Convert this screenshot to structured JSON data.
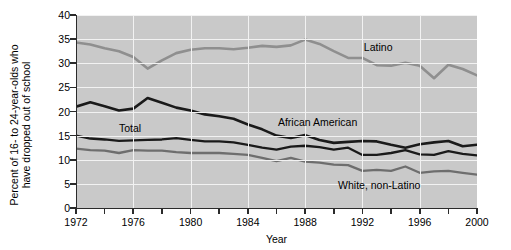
{
  "chart_data": {
    "type": "line",
    "title": "",
    "xlabel": "Year",
    "ylabel": "Percent of 16- to 24-year-olds who have dropped out of school",
    "ylabel_line1": "Percent of 16- to 24-year-olds who",
    "ylabel_line2": "have dropped out of school",
    "xlim": [
      1972,
      2000
    ],
    "ylim": [
      0,
      40
    ],
    "grid": true,
    "legend_position": "inline-annotations",
    "x": [
      1972,
      1973,
      1974,
      1975,
      1976,
      1977,
      1978,
      1979,
      1980,
      1981,
      1982,
      1983,
      1984,
      1985,
      1986,
      1987,
      1988,
      1989,
      1990,
      1991,
      1992,
      1993,
      1994,
      1995,
      1996,
      1997,
      1998,
      1999,
      2000
    ],
    "xticks": [
      1972,
      1974,
      1976,
      1978,
      1980,
      1982,
      1984,
      1986,
      1988,
      1990,
      1992,
      1994,
      1996,
      1998,
      2000
    ],
    "xticklabels": [
      "1972",
      "",
      "1976",
      "",
      "1980",
      "",
      "1984",
      "",
      "1988",
      "",
      "1992",
      "",
      "1996",
      "",
      "2000"
    ],
    "yticks": [
      0,
      5,
      10,
      15,
      20,
      25,
      30,
      35,
      40
    ],
    "yticklabels": [
      "0",
      "5",
      "10",
      "15",
      "20",
      "25",
      "30",
      "35",
      "40"
    ],
    "series": [
      {
        "name": "Latino",
        "color": "#8f8f8f",
        "width": 2.6,
        "label_x": 1992.1,
        "label_y": 33.2,
        "values": [
          34.3,
          33.9,
          33.1,
          32.5,
          31.3,
          28.9,
          30.6,
          32.1,
          32.8,
          33.1,
          33.1,
          32.9,
          33.2,
          33.6,
          33.4,
          33.7,
          34.9,
          34.0,
          32.5,
          31.1,
          31.1,
          29.6,
          29.5,
          30.1,
          29.5,
          26.9,
          29.7,
          28.8,
          27.5
        ]
      },
      {
        "name": "African American",
        "color": "#1a1a1a",
        "width": 2.6,
        "label_x": 1986.1,
        "label_y": 17.6,
        "values": [
          21.0,
          21.9,
          21.1,
          20.2,
          20.6,
          22.8,
          21.8,
          20.8,
          20.2,
          19.4,
          19.0,
          18.5,
          17.3,
          16.3,
          15.0,
          14.5,
          15.1,
          14.1,
          13.5,
          13.7,
          13.9,
          13.8,
          13.1,
          12.5,
          13.2,
          13.6,
          13.9,
          12.8,
          13.1
        ]
      },
      {
        "name": "Total",
        "color": "#1a1a1a",
        "width": 2.3,
        "label_x": 1975.0,
        "label_y": 16.3,
        "values": [
          15.0,
          14.4,
          14.2,
          13.9,
          14.0,
          14.1,
          14.2,
          14.5,
          14.1,
          13.8,
          13.8,
          13.6,
          13.1,
          12.5,
          12.1,
          12.7,
          12.9,
          12.6,
          12.1,
          12.5,
          11.0,
          11.0,
          11.4,
          12.0,
          11.1,
          11.0,
          11.8,
          11.2,
          10.9
        ]
      },
      {
        "name": "White, non-Latino",
        "color": "#6e6e6e",
        "width": 2.3,
        "label_x": 1990.3,
        "label_y": 4.6,
        "values": [
          12.3,
          12.0,
          11.9,
          11.4,
          12.0,
          11.9,
          11.9,
          11.6,
          11.4,
          11.4,
          11.4,
          11.2,
          11.0,
          10.4,
          9.7,
          10.4,
          9.6,
          9.4,
          9.0,
          8.9,
          7.7,
          7.9,
          7.7,
          8.6,
          7.3,
          7.6,
          7.7,
          7.3,
          6.9
        ]
      }
    ]
  }
}
